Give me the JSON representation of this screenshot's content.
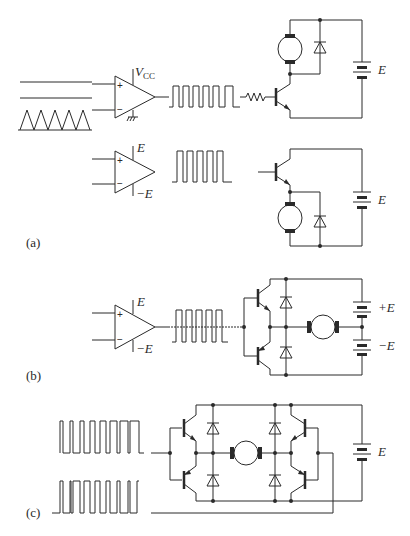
{
  "figure": {
    "panels": [
      {
        "id": "a",
        "label": "(a)",
        "description": "PWM comparator driving single-transistor DC motor chopper (low-side and high-side)",
        "top_circuit": {
          "comparator_supply_label": "V",
          "comparator_supply_subscript": "CC",
          "comparator_plus": "+",
          "comparator_minus": "−",
          "battery_label": "E"
        },
        "bottom_circuit": {
          "comparator_supply_pos": "E",
          "comparator_supply_neg": "−E",
          "comparator_plus": "+",
          "comparator_minus": "−",
          "battery_label": "E"
        }
      },
      {
        "id": "b",
        "label": "(b)",
        "description": "Half-bridge with split supply",
        "comparator_supply_pos": "E",
        "comparator_supply_neg": "−E",
        "comparator_plus": "+",
        "comparator_minus": "−",
        "battery_top_label": "+E",
        "battery_bottom_label": "−E"
      },
      {
        "id": "c",
        "label": "(c)",
        "description": "Full H-bridge driven by two PWM pulse trains",
        "battery_label": "E"
      }
    ]
  }
}
